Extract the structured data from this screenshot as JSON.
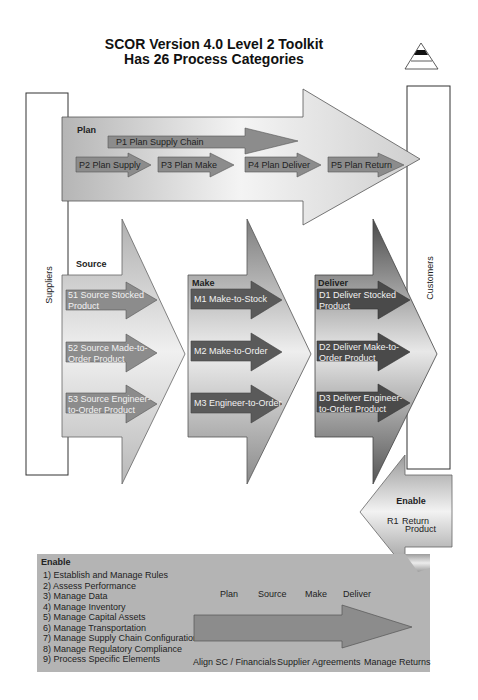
{
  "title": {
    "line1": "SCOR Version 4.0 Level 2 Toolkit",
    "line2": "Has 26 Process Categories"
  },
  "suppliers_label": "Suppliers",
  "customers_label": "Customers",
  "plan": {
    "label": "Plan",
    "p1": "P1 Plan Supply Chain",
    "items": [
      "P2 Plan Supply",
      "P3 Plan Make",
      "P4 Plan Deliver",
      "P5 Plan Return"
    ]
  },
  "source": {
    "label": "Source",
    "items": [
      {
        "line1": "51 Source Stocked",
        "line2": "Product"
      },
      {
        "line1": "52 Source Made-to-",
        "line2": "Order Product"
      },
      {
        "line1": "53 Source Engineer-",
        "line2": "to-Order Product"
      }
    ]
  },
  "make": {
    "label": "Make",
    "items": [
      "M1 Make-to-Stock",
      "M2 Make-to-Order",
      "M3 Engineer-to-Order"
    ]
  },
  "deliver": {
    "label": "Deliver",
    "items": [
      {
        "line1": "D1 Deliver Stocked",
        "line2": "Product"
      },
      {
        "line1": "D2 Deliver Make-to-",
        "line2": "Order Product"
      },
      {
        "line1": "D3 Deliver Engineer-",
        "line2": "to-Order Product"
      }
    ]
  },
  "return_enable": {
    "label": "Enable",
    "code": "R1",
    "line1": "Return",
    "line2": "Product"
  },
  "enable": {
    "label": "Enable",
    "items": [
      "1) Establish and Manage Rules",
      "2) Assess Performance",
      "3) Manage Data",
      "4) Manage Inventory",
      "5) Manage Capital Assets",
      "6) Manage Transportation",
      "7) Manage Supply Chain Configuration",
      "8) Manage Regulatory Compliance",
      "9) Process Specific Elements"
    ],
    "top_labels": [
      "Plan",
      "Source",
      "Make",
      "Deliver"
    ],
    "bottom_labels": [
      "Align SC / Financials",
      "Supplier Agreements",
      "Manage Returns"
    ]
  },
  "colors": {
    "inner_arrow": "#8a8a8a",
    "dark_arrow": "#555555",
    "enable_bg": "#b4b4b4"
  }
}
